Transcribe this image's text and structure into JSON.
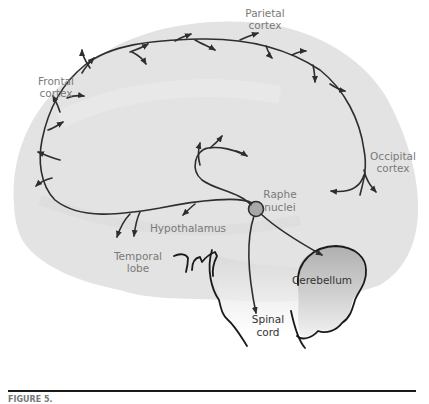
{
  "figure": {
    "labels": {
      "parietal": [
        "Parietal",
        "cortex"
      ],
      "frontal": [
        "Frontal",
        "cortex"
      ],
      "occipital": [
        "Occipital",
        "cortex"
      ],
      "raphe": [
        "Raphe",
        "nuclei"
      ],
      "hypothalamus": "Hypothalamus",
      "temporal": [
        "Temporal",
        "lobe"
      ],
      "cerebellum": "Cerebellum",
      "spinal": [
        "Spinal",
        "cord"
      ]
    },
    "caption": "FIGURE 5.",
    "colors": {
      "brain_fill": "#e2e2e2",
      "cerebellum_fill": "#bdbdbd",
      "nucleus_fill": "#a8a8a8",
      "pathway": "#2e2e2e",
      "label": "#7a7a7a"
    }
  }
}
